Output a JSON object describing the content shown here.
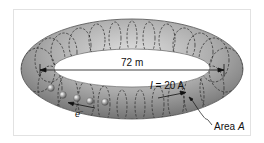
{
  "figure": {
    "type": "toroid diagram",
    "labels": {
      "diameter": "72 m",
      "current_symbol": "I",
      "current_eq": " = 20 A",
      "electron": "e",
      "electron_sup": "−",
      "area_prefix": "Area ",
      "area_symbol": "A"
    },
    "colors": {
      "torus_fill": "#a9a9a9",
      "torus_light": "#d6d6d6",
      "torus_dark": "#5f5f5f",
      "coil": "#2b2b2b",
      "frame": "#e2e2e2"
    },
    "electron_count": 5
  }
}
